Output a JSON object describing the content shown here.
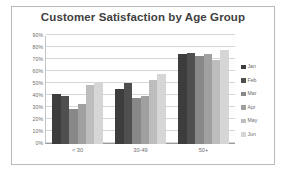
{
  "chart_data": {
    "type": "bar",
    "title": "Customer Satisfaction by Age Group",
    "xlabel": "",
    "ylabel": "",
    "categories": [
      "< 30",
      "30-49",
      "50+"
    ],
    "series": [
      {
        "name": "Jan",
        "color": "#3d3d3d",
        "values": [
          42,
          46,
          75
        ]
      },
      {
        "name": "Feb",
        "color": "#4f4f4f",
        "values": [
          40,
          51,
          76
        ]
      },
      {
        "name": "Mar",
        "color": "#888888",
        "values": [
          29,
          38,
          73
        ]
      },
      {
        "name": "Apr",
        "color": "#a0a0a0",
        "values": [
          33,
          40,
          75
        ]
      },
      {
        "name": "May",
        "color": "#bdbdbd",
        "values": [
          49,
          53,
          70
        ]
      },
      {
        "name": "Jun",
        "color": "#d6d6d6",
        "values": [
          51,
          58,
          78
        ]
      }
    ],
    "ylim": [
      0,
      90
    ],
    "yticks": [
      "0%",
      "10%",
      "20%",
      "30%",
      "40%",
      "50%",
      "60%",
      "70%",
      "80%",
      "90%"
    ],
    "ytick_values": [
      0,
      10,
      20,
      30,
      40,
      50,
      60,
      70,
      80,
      90
    ],
    "grid": true,
    "legend_position": "right"
  },
  "frame": {
    "border_color": "#b9b9b9",
    "background": "#ffffff"
  },
  "style": {
    "title_color": "#3f3f3f",
    "tick_color": "#6d6d6d",
    "gridline_color": "#d6d6d6",
    "axis_color": "#9a9a9a"
  }
}
